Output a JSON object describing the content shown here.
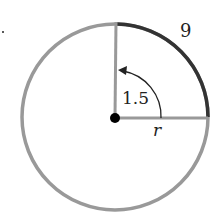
{
  "diagram": {
    "arc_length_label": "9",
    "angle_label": "1.5",
    "radius_label": "r",
    "colors": {
      "circle": "#999999",
      "arc": "#333333",
      "center": "#000000"
    }
  }
}
